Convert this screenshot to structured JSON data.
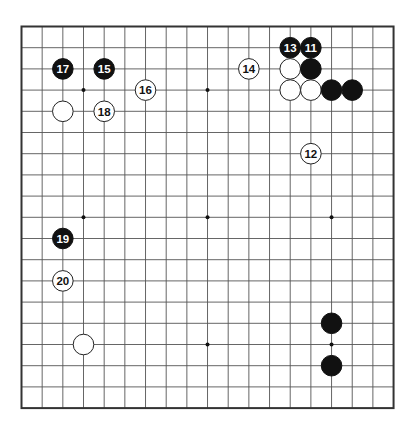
{
  "board": {
    "size": 19,
    "origin": {
      "x": 21.5,
      "y": 26.5
    },
    "spacing": {
      "x": 20.67,
      "y": 21.2
    },
    "line_color": "#555555",
    "border_color": "#333333",
    "background": "#ffffff",
    "star_points": [
      [
        3,
        3
      ],
      [
        9,
        3
      ],
      [
        15,
        3
      ],
      [
        3,
        9
      ],
      [
        9,
        9
      ],
      [
        15,
        9
      ],
      [
        3,
        15
      ],
      [
        9,
        15
      ],
      [
        15,
        15
      ]
    ]
  },
  "stones": [
    {
      "color": "black",
      "col": 14,
      "row": 1,
      "label": "11"
    },
    {
      "color": "white",
      "col": 14,
      "row": 6,
      "label": "12"
    },
    {
      "color": "black",
      "col": 13,
      "row": 1,
      "label": "13"
    },
    {
      "color": "white",
      "col": 11,
      "row": 2,
      "label": "14"
    },
    {
      "color": "black",
      "col": 4,
      "row": 2,
      "label": "15"
    },
    {
      "color": "white",
      "col": 6,
      "row": 3,
      "label": "16"
    },
    {
      "color": "black",
      "col": 2,
      "row": 2,
      "label": "17"
    },
    {
      "color": "white",
      "col": 4,
      "row": 4,
      "label": "18"
    },
    {
      "color": "black",
      "col": 2,
      "row": 10,
      "label": "19"
    },
    {
      "color": "white",
      "col": 2,
      "row": 12,
      "label": "20"
    },
    {
      "color": "white",
      "col": 13,
      "row": 2,
      "label": ""
    },
    {
      "color": "black",
      "col": 14,
      "row": 2,
      "label": ""
    },
    {
      "color": "white",
      "col": 13,
      "row": 3,
      "label": ""
    },
    {
      "color": "white",
      "col": 14,
      "row": 3,
      "label": ""
    },
    {
      "color": "black",
      "col": 15,
      "row": 3,
      "label": ""
    },
    {
      "color": "black",
      "col": 16,
      "row": 3,
      "label": ""
    },
    {
      "color": "white",
      "col": 2,
      "row": 4,
      "label": ""
    },
    {
      "color": "white",
      "col": 3,
      "row": 15,
      "label": ""
    },
    {
      "color": "black",
      "col": 15,
      "row": 14,
      "label": ""
    },
    {
      "color": "black",
      "col": 15,
      "row": 16,
      "label": ""
    }
  ]
}
